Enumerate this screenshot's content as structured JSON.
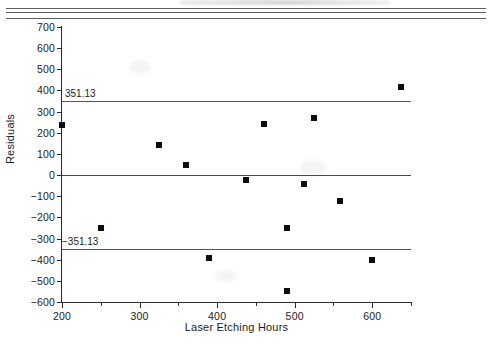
{
  "header": {
    "rules_count": 3,
    "note": "cut-off header rules"
  },
  "chart_data": {
    "type": "scatter",
    "title": "",
    "xlabel": "Laser Etching Hours",
    "ylabel": "Residuals",
    "xlim": [
      200,
      650
    ],
    "ylim": [
      -600,
      700
    ],
    "grid": false,
    "legend": "none",
    "x_major_ticks": [
      200,
      300,
      400,
      500,
      600
    ],
    "x_minor_ticks": [
      250,
      350,
      450,
      550,
      650
    ],
    "x_ticklabels": [
      "200",
      "300",
      "400",
      "500",
      "600"
    ],
    "y_ticks": [
      700,
      600,
      500,
      400,
      300,
      200,
      100,
      0,
      -100,
      -200,
      -300,
      -400,
      -500,
      -600
    ],
    "y_ticklabels": [
      "700",
      "600",
      "500",
      "400",
      "300",
      "200",
      "100",
      "0",
      "−100",
      "−200",
      "−300",
      "−400",
      "−500",
      "−600"
    ],
    "reference_lines": [
      {
        "name": "upper-control-limit",
        "value": 351.13,
        "label": "351.13"
      },
      {
        "name": "center-line",
        "value": 0,
        "label": ""
      },
      {
        "name": "lower-control-limit",
        "value": -351.13,
        "label": "−351.13"
      }
    ],
    "marker": {
      "shape": "square",
      "color": "#0d0d0d",
      "size": 6
    },
    "points": [
      {
        "x": 200,
        "y": 235
      },
      {
        "x": 250,
        "y": -250
      },
      {
        "x": 325,
        "y": 143
      },
      {
        "x": 360,
        "y": 50
      },
      {
        "x": 390,
        "y": -390
      },
      {
        "x": 437,
        "y": -25
      },
      {
        "x": 460,
        "y": 240
      },
      {
        "x": 490,
        "y": -248
      },
      {
        "x": 490,
        "y": -550
      },
      {
        "x": 512,
        "y": -42
      },
      {
        "x": 525,
        "y": 268
      },
      {
        "x": 558,
        "y": -122
      },
      {
        "x": 600,
        "y": -400
      },
      {
        "x": 637,
        "y": 415
      }
    ]
  },
  "colors": {
    "marker": "#0d0d0d",
    "axis": "#2a2a2a",
    "refline": "#555555",
    "background": "#ffffff"
  }
}
